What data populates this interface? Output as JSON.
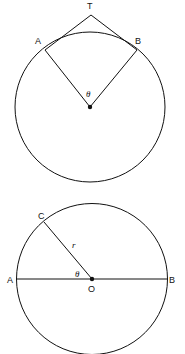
{
  "figure1": {
    "labels": {
      "T": "T",
      "A": "A",
      "B": "B",
      "theta": "θ"
    }
  },
  "figure2": {
    "labels": {
      "C": "C",
      "r": "r",
      "theta": "θ",
      "A": "A",
      "O": "O",
      "B": "B"
    }
  }
}
